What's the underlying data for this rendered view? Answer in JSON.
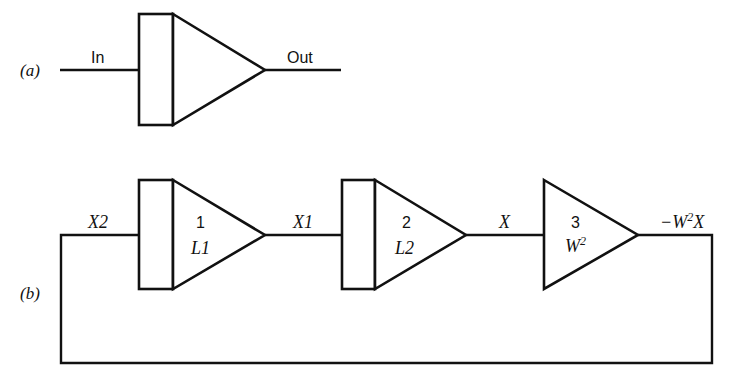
{
  "part_a": {
    "label": "(a)",
    "input_label": "In",
    "output_label": "Out"
  },
  "part_b": {
    "label": "(b)",
    "signals": {
      "input": "X2",
      "stage1_out": "X1",
      "stage2_out": "X",
      "output_prefix": "−W",
      "output_sup": "2",
      "output_suffix": "X"
    },
    "stages": [
      {
        "number": "1",
        "gain": "L1",
        "type": "integrator"
      },
      {
        "number": "2",
        "gain": "L2",
        "type": "integrator"
      },
      {
        "number": "3",
        "gain_base": "W",
        "gain_sup": "2",
        "type": "amplifier"
      }
    ]
  },
  "colors": {
    "line": "#111111",
    "background": "#ffffff"
  }
}
